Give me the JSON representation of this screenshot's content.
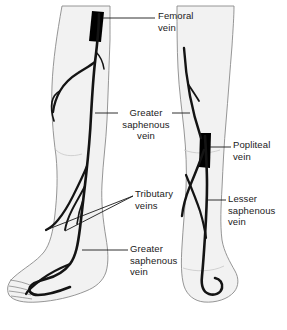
{
  "figure": {
    "background_color": "#ffffff",
    "skin_fill": "#f2f2f2",
    "skin_outline": "#7a7a7a",
    "vein_color": "#1a1a1a",
    "marker_color": "#000000",
    "leader_color": "#1a1a1a",
    "views": [
      {
        "name": "left-leg-anterior-view",
        "side": "left"
      },
      {
        "name": "right-leg-posterior-view",
        "side": "right"
      }
    ]
  },
  "labels": [
    {
      "id": "femoral-vein",
      "text": "Femoral\nvein",
      "align": "left",
      "x": 158,
      "y": 10
    },
    {
      "id": "greater-saphenous-vein-upper",
      "text": "Greater\nsaphenous\nvein",
      "align": "center",
      "x": 122,
      "y": 107
    },
    {
      "id": "popliteal-vein",
      "text": "Popliteal\nvein",
      "align": "left",
      "x": 233,
      "y": 139
    },
    {
      "id": "tributary-veins",
      "text": "Tributary\nveins",
      "align": "left",
      "x": 135,
      "y": 188
    },
    {
      "id": "lesser-saphenous-vein",
      "text": "Lesser\nsaphenous\nvein",
      "align": "left",
      "x": 228,
      "y": 193
    },
    {
      "id": "greater-saphenous-vein-lower",
      "text": "Greater\nsaphenous\nvein",
      "align": "left",
      "x": 130,
      "y": 243
    }
  ],
  "markers": [
    {
      "id": "femoral-vein-marker",
      "label_ref": "femoral-vein"
    },
    {
      "id": "popliteal-vein-marker",
      "label_ref": "popliteal-vein"
    }
  ]
}
